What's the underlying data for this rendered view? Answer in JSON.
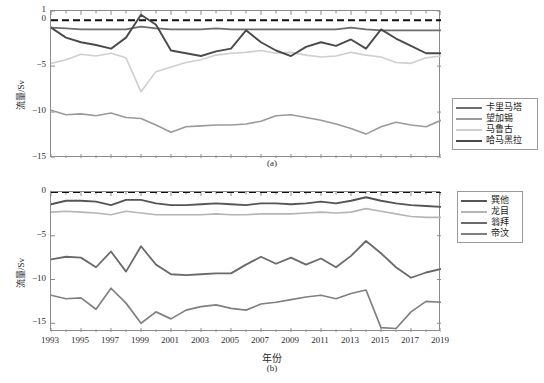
{
  "figure": {
    "background": "#ffffff",
    "axis_color": "#8c8c8c",
    "zero_line_color": "#111111"
  },
  "axis": {
    "ylabel": "流量/Sv",
    "xlabel": "年份",
    "xticks": [
      "1993",
      "1995",
      "1997",
      "1999",
      "2001",
      "2003",
      "2005",
      "2007",
      "2009",
      "2011",
      "2013",
      "2015",
      "2017",
      "2019"
    ],
    "panel_a_yticks": [
      "1",
      "0",
      "−5",
      "−10",
      "−15"
    ],
    "panel_b_yticks": [
      "0",
      "−5",
      "−10",
      "−15"
    ],
    "panel_a_tag": "(a)",
    "panel_b_tag": "(b)"
  },
  "legend_a": {
    "items": [
      {
        "label": "卡里马塔",
        "color": "#6e6e6e",
        "width": 1.8
      },
      {
        "label": "望加锡",
        "color": "#9a9a9a",
        "width": 1.6
      },
      {
        "label": "马鲁古",
        "color": "#cfcfcf",
        "width": 1.6
      },
      {
        "label": "哈马黑拉",
        "color": "#4a4a4a",
        "width": 1.9
      }
    ]
  },
  "legend_b": {
    "items": [
      {
        "label": "巽他",
        "color": "#555555",
        "width": 1.8
      },
      {
        "label": "龙目",
        "color": "#b5b5b5",
        "width": 1.6
      },
      {
        "label": "翁拜",
        "color": "#6a6a6a",
        "width": 1.8
      },
      {
        "label": "帝汶",
        "color": "#808080",
        "width": 1.7
      }
    ]
  },
  "chart_data": [
    {
      "type": "line",
      "panel": "(a)",
      "title": "",
      "xlabel": "年份",
      "ylabel": "流量/Sv",
      "xlim": [
        1993,
        2019
      ],
      "ylim": [
        -15,
        1
      ],
      "yticks": [
        1,
        0,
        -5,
        -10,
        -15
      ],
      "grid": false,
      "legend_position": "right-outside",
      "annotations": [
        {
          "type": "hline",
          "y": 0,
          "style": "dashed",
          "color": "#111111"
        }
      ],
      "x": [
        1993,
        1994,
        1995,
        1996,
        1997,
        1998,
        1999,
        2000,
        2001,
        2002,
        2003,
        2004,
        2005,
        2006,
        2007,
        2008,
        2009,
        2010,
        2011,
        2012,
        2013,
        2014,
        2015,
        2016,
        2017,
        2018,
        2019
      ],
      "series": [
        {
          "name": "卡里马塔",
          "color": "#6e6e6e",
          "values": [
            -0.8,
            -0.9,
            -1.0,
            -1.0,
            -1.0,
            -1.0,
            -0.7,
            -0.9,
            -1.0,
            -1.0,
            -1.0,
            -0.9,
            -1.0,
            -1.0,
            -1.0,
            -1.0,
            -1.0,
            -1.0,
            -1.0,
            -1.0,
            -0.8,
            -1.0,
            -1.1,
            -1.1,
            -1.1,
            -1.1,
            -1.1
          ]
        },
        {
          "name": "望加锡",
          "color": "#9a9a9a",
          "values": [
            -9.8,
            -10.3,
            -10.2,
            -10.4,
            -10.1,
            -10.6,
            -10.7,
            -11.4,
            -12.2,
            -11.6,
            -11.5,
            -11.4,
            -11.4,
            -11.3,
            -11.0,
            -10.4,
            -10.3,
            -10.6,
            -10.9,
            -11.3,
            -11.8,
            -12.4,
            -11.6,
            -11.1,
            -11.4,
            -11.6,
            -10.9
          ]
        },
        {
          "name": "马鲁古",
          "color": "#cfcfcf",
          "values": [
            -4.7,
            -4.3,
            -3.7,
            -3.9,
            -3.6,
            -4.1,
            -7.8,
            -5.6,
            -5.1,
            -4.6,
            -4.3,
            -3.8,
            -3.6,
            -3.5,
            -3.3,
            -3.6,
            -3.5,
            -3.8,
            -4.0,
            -3.9,
            -3.5,
            -3.8,
            -4.0,
            -4.6,
            -4.7,
            -4.1,
            -3.9
          ]
        },
        {
          "name": "哈马黑拉",
          "color": "#4a4a4a",
          "values": [
            -0.8,
            -1.9,
            -2.4,
            -2.7,
            -3.1,
            -1.9,
            0.6,
            -0.5,
            -3.3,
            -3.6,
            -3.9,
            -3.4,
            -3.1,
            -1.1,
            -2.4,
            -3.3,
            -3.9,
            -2.9,
            -2.4,
            -2.8,
            -2.1,
            -3.1,
            -1.0,
            -2.0,
            -2.8,
            -3.6,
            -3.6
          ]
        }
      ]
    },
    {
      "type": "line",
      "panel": "(b)",
      "title": "",
      "xlabel": "年份",
      "ylabel": "流量/Sv",
      "xlim": [
        1993,
        2019
      ],
      "ylim": [
        -16,
        0
      ],
      "yticks": [
        0,
        -5,
        -10,
        -15
      ],
      "grid": false,
      "legend_position": "right-outside",
      "annotations": [
        {
          "type": "hline",
          "y": 0,
          "style": "dashed",
          "color": "#111111"
        }
      ],
      "x": [
        1993,
        1994,
        1995,
        1996,
        1997,
        1998,
        1999,
        2000,
        2001,
        2002,
        2003,
        2004,
        2005,
        2006,
        2007,
        2008,
        2009,
        2010,
        2011,
        2012,
        2013,
        2014,
        2015,
        2016,
        2017,
        2018,
        2019
      ],
      "series": [
        {
          "name": "巽他",
          "color": "#555555",
          "values": [
            -1.4,
            -1.0,
            -1.0,
            -1.1,
            -1.5,
            -0.9,
            -0.9,
            -1.3,
            -1.5,
            -1.5,
            -1.4,
            -1.3,
            -1.4,
            -1.5,
            -1.3,
            -1.3,
            -1.4,
            -1.3,
            -1.1,
            -1.3,
            -1.0,
            -0.6,
            -1.0,
            -1.3,
            -1.5,
            -1.6,
            -1.7
          ]
        },
        {
          "name": "龙目",
          "color": "#b5b5b5",
          "values": [
            -2.3,
            -2.2,
            -2.3,
            -2.4,
            -2.6,
            -2.2,
            -2.4,
            -2.6,
            -2.6,
            -2.6,
            -2.6,
            -2.5,
            -2.6,
            -2.6,
            -2.5,
            -2.5,
            -2.5,
            -2.4,
            -2.3,
            -2.4,
            -2.3,
            -1.9,
            -2.2,
            -2.5,
            -2.8,
            -2.9,
            -2.9
          ]
        },
        {
          "name": "翁拜",
          "color": "#6a6a6a",
          "values": [
            -7.7,
            -7.4,
            -7.5,
            -8.6,
            -6.8,
            -9.1,
            -6.2,
            -8.3,
            -9.4,
            -9.5,
            -9.4,
            -9.3,
            -9.3,
            -8.3,
            -7.4,
            -8.2,
            -7.5,
            -8.3,
            -7.6,
            -8.6,
            -7.3,
            -5.6,
            -7.0,
            -8.6,
            -9.8,
            -9.2,
            -8.8
          ]
        },
        {
          "name": "帝汶",
          "color": "#808080",
          "values": [
            -11.8,
            -12.2,
            -12.1,
            -13.4,
            -11.0,
            -12.7,
            -15.0,
            -13.7,
            -14.5,
            -13.5,
            -13.1,
            -12.9,
            -13.3,
            -13.5,
            -12.8,
            -12.6,
            -12.3,
            -12.0,
            -11.8,
            -12.2,
            -11.6,
            -11.2,
            -15.5,
            -15.6,
            -13.7,
            -12.5,
            -12.6
          ]
        }
      ]
    }
  ]
}
